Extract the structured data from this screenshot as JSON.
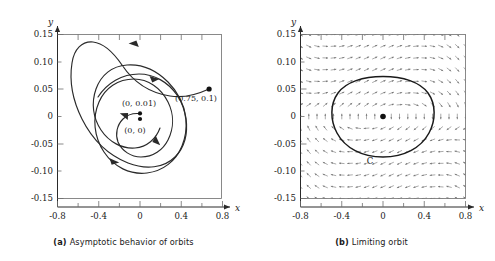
{
  "figure": {
    "panels": [
      {
        "id": "a",
        "caption_tag": "(a)",
        "caption_text": "Asymptotic behavior of orbits",
        "axis": {
          "x_name": "x",
          "y_name": "y"
        },
        "x_ticks": [
          "-0.8",
          "-0.4",
          "0",
          "0.4",
          "0.8"
        ],
        "y_ticks": [
          "0.15",
          "0.10",
          "0.05",
          "0",
          "-0.05",
          "-0.10",
          "-0.15"
        ],
        "annotations": [
          {
            "name": "initial-point-label",
            "text": "(0.75, 0.1)"
          },
          {
            "name": "inner-start-label",
            "text": "(0, 0.01)"
          },
          {
            "name": "origin-label",
            "text": "(0, 0)"
          }
        ]
      },
      {
        "id": "b",
        "caption_tag": "(b)",
        "caption_text": "Limiting orbit",
        "axis": {
          "x_name": "x",
          "y_name": "y"
        },
        "x_ticks": [
          "-0.8",
          "-0.4",
          "0",
          "0.4",
          "0.8"
        ],
        "y_ticks": [
          "0.15",
          "0.10",
          "0.05",
          "0",
          "-0.05",
          "-0.10",
          "-0.15"
        ],
        "annotations": [
          {
            "name": "limit-cycle-label",
            "text": "C"
          }
        ]
      }
    ]
  },
  "chart_data": {
    "type": "scatter",
    "subcharts": [
      {
        "panel": "a",
        "type": "line",
        "title": "Asymptotic behavior of orbits",
        "xlabel": "x",
        "ylabel": "y",
        "xlim": [
          -0.9,
          0.9
        ],
        "ylim": [
          -0.165,
          0.165
        ],
        "xticks": [
          -0.8,
          -0.4,
          0,
          0.4,
          0.8
        ],
        "xtick_labels": [
          "-0.8",
          "-0.4",
          "0",
          "0.4",
          "0.8"
        ],
        "yticks": [
          0.15,
          0.1,
          0.05,
          0,
          -0.05,
          -0.1,
          -0.15
        ],
        "ytick_labels": [
          "0.15",
          "0.10",
          "0.05",
          "0",
          "-0.05",
          "-0.10",
          "-0.15"
        ],
        "minor_ticks": true,
        "grid": false,
        "legend": "none",
        "points": [
          {
            "label": "(0.75, 0.1)",
            "x": 0.75,
            "y": 0.1,
            "marker": "filled-circle"
          },
          {
            "label": "(0, 0.01)",
            "x": 0.0,
            "y": 0.01,
            "marker": "filled-circle"
          },
          {
            "label": "(0, 0)",
            "x": 0.0,
            "y": 0.0,
            "marker": "filled-circle"
          }
        ],
        "series": [
          {
            "name": "outer-orbit-spiralling-inward",
            "comment": "trajectory starting at (0.75, 0.1), spirals clockwise inward onto the limit cycle",
            "direction": "clockwise",
            "start": [
              0.75,
              0.1
            ],
            "approaches": "limit cycle C"
          },
          {
            "name": "inner-orbit-spiralling-outward",
            "comment": "trajectory starting at (0, 0.01), spirals clockwise outward onto the limit cycle",
            "direction": "clockwise",
            "start": [
              0.0,
              0.01
            ],
            "approaches": "limit cycle C"
          }
        ]
      },
      {
        "panel": "b",
        "type": "quiver",
        "title": "Limiting orbit",
        "xlabel": "x",
        "ylabel": "y",
        "xlim": [
          -0.9,
          0.9
        ],
        "ylim": [
          -0.165,
          0.165
        ],
        "xticks": [
          -0.8,
          -0.4,
          0,
          0.4,
          0.8
        ],
        "xtick_labels": [
          "-0.8",
          "-0.4",
          "0",
          "0.4",
          "0.8"
        ],
        "yticks": [
          0.15,
          0.1,
          0.05,
          0,
          -0.05,
          -0.1,
          -0.15
        ],
        "ytick_labels": [
          "0.15",
          "0.10",
          "0.05",
          "0",
          "-0.05",
          "-0.10",
          "-0.15"
        ],
        "minor_ticks": true,
        "grid": false,
        "legend": "none",
        "vector_field": {
          "description": "direction field rotating clockwise about the origin, with outward flow near x = -0.55 and x = +0.55",
          "grid_cols": 21,
          "grid_rows": 15
        },
        "points": [
          {
            "label": "",
            "x": 0.0,
            "y": 0.0,
            "marker": "filled-circle"
          }
        ],
        "series": [
          {
            "name": "C",
            "comment": "closed limit cycle enclosing the origin",
            "closed": true,
            "x_extent": [
              -0.45,
              0.45
            ],
            "y_extent": [
              -0.082,
              0.078
            ]
          }
        ]
      }
    ]
  }
}
